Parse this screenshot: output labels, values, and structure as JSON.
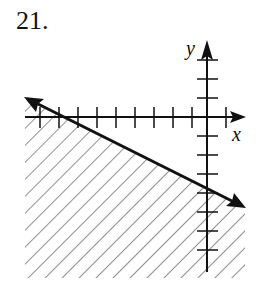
{
  "problem_number": "21.",
  "axes": {
    "x_label": "x",
    "y_label": "y",
    "tick_spacing_px": 19
  },
  "graph": {
    "type": "linear inequality",
    "boundary_line": "solid, negative slope, crosses x-axis at about x = -8 and y-axis at about y = -4",
    "shaded_region": "below the line (hatched)"
  },
  "colors": {
    "ink": "#111111",
    "hatch": "#555555",
    "background": "#ffffff"
  }
}
